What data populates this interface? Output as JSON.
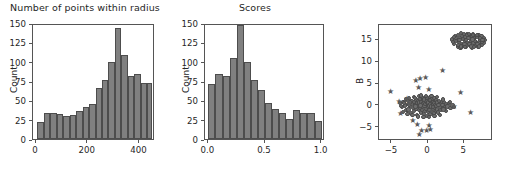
{
  "figure": {
    "width": 509,
    "height": 178,
    "background": "#ffffff",
    "bar_color": "#808080",
    "bar_edge_color": "#4d4d4d",
    "marker_color": "#6e6e6e",
    "axis_color": "#555555",
    "text_color": "#262626"
  },
  "chart_data": [
    {
      "type": "bar",
      "title": "Number of points within radius",
      "xlabel": "",
      "ylabel": "Count",
      "xlim": [
        -12,
        460
      ],
      "ylim": [
        0,
        150
      ],
      "xticks": [
        0,
        200,
        400
      ],
      "xticklabels": [
        "0",
        "200",
        "400"
      ],
      "yticks": [
        0,
        25,
        50,
        75,
        100,
        125,
        150
      ],
      "yticklabels": [
        "0",
        "25",
        "50",
        "75",
        "100",
        "125",
        "150"
      ],
      "grid": false,
      "legend": "none",
      "bin_edges": [
        5,
        30,
        55,
        80,
        105,
        130,
        155,
        180,
        205,
        230,
        255,
        280,
        305,
        330,
        355,
        380,
        405,
        430,
        450
      ],
      "categories": [
        "5-30",
        "30-55",
        "55-80",
        "80-105",
        "105-130",
        "130-155",
        "155-180",
        "180-205",
        "205-230",
        "230-255",
        "255-280",
        "280-305",
        "305-330",
        "330-355",
        "355-380",
        "380-405",
        "405-430",
        "430-450"
      ],
      "values": [
        22,
        33,
        33,
        32,
        30,
        31,
        36,
        42,
        45,
        66,
        76,
        100,
        143,
        109,
        82,
        84,
        72,
        72
      ]
    },
    {
      "type": "bar",
      "title": "Scores",
      "xlabel": "",
      "ylabel": "Count",
      "xlim": [
        -0.03,
        1.03
      ],
      "ylim": [
        0,
        150
      ],
      "xticks": [
        0.0,
        0.5,
        1.0
      ],
      "xticklabels": [
        "0.0",
        "0.5",
        "1.0"
      ],
      "yticks": [
        0,
        25,
        50,
        75,
        100,
        125,
        150
      ],
      "yticklabels": [
        "0",
        "25",
        "50",
        "75",
        "100",
        "125",
        "150"
      ],
      "grid": false,
      "legend": "none",
      "bin_edges": [
        0.0,
        0.0625,
        0.125,
        0.1875,
        0.25,
        0.3125,
        0.375,
        0.4375,
        0.5,
        0.5625,
        0.625,
        0.6875,
        0.75,
        0.8125,
        0.875,
        0.9375,
        1.0
      ],
      "categories": [
        "0.000-0.063",
        "0.063-0.125",
        "0.125-0.188",
        "0.188-0.250",
        "0.250-0.313",
        "0.313-0.375",
        "0.375-0.438",
        "0.438-0.500",
        "0.500-0.563",
        "0.563-0.625",
        "0.625-0.688",
        "0.688-0.750",
        "0.750-0.813",
        "0.813-0.875",
        "0.875-0.938",
        "0.938-1.000"
      ],
      "values": [
        71,
        84,
        82,
        105,
        148,
        100,
        76,
        63,
        47,
        39,
        34,
        26,
        37,
        33,
        33,
        23
      ]
    },
    {
      "type": "scatter",
      "title": "",
      "xlabel": "",
      "ylabel": "B",
      "xlim": [
        -6.8,
        9.0
      ],
      "ylim": [
        -8.0,
        18.5
      ],
      "xticks": [
        -5,
        0,
        5
      ],
      "xticklabels": [
        "−5",
        "0",
        "5"
      ],
      "yticks": [
        -5,
        0,
        5,
        10,
        15
      ],
      "yticklabels": [
        "−5",
        "0",
        "5",
        "10",
        "15"
      ],
      "grid": false,
      "legend": "none",
      "series": [
        {
          "name": "cluster-upper",
          "marker": "circle",
          "points": [
            [
              3.3,
              15.2
            ],
            [
              3.6,
              14.2
            ],
            [
              3.7,
              16.0
            ],
            [
              4.0,
              15.1
            ],
            [
              4.1,
              13.6
            ],
            [
              4.2,
              16.3
            ],
            [
              4.3,
              14.6
            ],
            [
              4.4,
              15.6
            ],
            [
              4.5,
              13.2
            ],
            [
              4.6,
              16.6
            ],
            [
              4.7,
              14.1
            ],
            [
              4.8,
              15.3
            ],
            [
              4.9,
              13.8
            ],
            [
              5.0,
              16.1
            ],
            [
              5.1,
              14.8
            ],
            [
              5.2,
              15.8
            ],
            [
              5.3,
              13.4
            ],
            [
              5.4,
              16.4
            ],
            [
              5.5,
              14.4
            ],
            [
              5.6,
              15.5
            ],
            [
              5.7,
              13.9
            ],
            [
              5.8,
              16.2
            ],
            [
              5.9,
              14.9
            ],
            [
              6.0,
              15.9
            ],
            [
              6.1,
              13.3
            ],
            [
              6.2,
              16.5
            ],
            [
              6.3,
              14.3
            ],
            [
              6.4,
              15.4
            ],
            [
              6.5,
              13.7
            ],
            [
              6.6,
              16.0
            ],
            [
              6.7,
              14.7
            ],
            [
              6.8,
              15.7
            ],
            [
              6.9,
              13.5
            ],
            [
              7.0,
              16.3
            ],
            [
              7.1,
              14.5
            ],
            [
              7.2,
              15.2
            ],
            [
              7.3,
              14.0
            ],
            [
              7.4,
              15.9
            ],
            [
              7.5,
              13.9
            ],
            [
              7.6,
              14.8
            ],
            [
              7.7,
              15.4
            ],
            [
              7.8,
              14.3
            ],
            [
              7.9,
              15.0
            ],
            [
              3.9,
              14.9
            ],
            [
              4.35,
              15.0
            ],
            [
              5.05,
              14.2
            ],
            [
              5.75,
              14.1
            ],
            [
              6.45,
              14.9
            ],
            [
              7.15,
              15.6
            ],
            [
              4.75,
              16.0
            ],
            [
              5.45,
              16.2
            ],
            [
              6.15,
              15.2
            ],
            [
              6.85,
              14.2
            ],
            [
              3.5,
              14.6
            ],
            [
              4.15,
              14.0
            ],
            [
              5.25,
              15.1
            ],
            [
              6.05,
              16.0
            ],
            [
              6.75,
              16.2
            ],
            [
              7.45,
              14.6
            ],
            [
              3.8,
              15.6
            ],
            [
              4.55,
              13.6
            ],
            [
              5.15,
              13.5
            ],
            [
              5.95,
              13.6
            ],
            [
              6.35,
              13.4
            ],
            [
              7.05,
              13.6
            ],
            [
              4.95,
              16.4
            ],
            [
              5.65,
              16.5
            ],
            [
              6.25,
              16.3
            ],
            [
              3.65,
              15.8
            ],
            [
              7.55,
              15.1
            ]
          ]
        },
        {
          "name": "cluster-lower",
          "marker": "circle",
          "points": [
            [
              -3.9,
              0.6
            ],
            [
              -3.6,
              -0.3
            ],
            [
              -3.4,
              1.0
            ],
            [
              -3.2,
              0.1
            ],
            [
              -3.0,
              -1.0
            ],
            [
              -2.9,
              1.4
            ],
            [
              -2.8,
              0.4
            ],
            [
              -2.7,
              -0.8
            ],
            [
              -2.6,
              1.8
            ],
            [
              -2.5,
              0.0
            ],
            [
              -2.4,
              -1.6
            ],
            [
              -2.3,
              1.1
            ],
            [
              -2.2,
              0.5
            ],
            [
              -2.1,
              -0.5
            ],
            [
              -2.0,
              2.0
            ],
            [
              -1.95,
              0.9
            ],
            [
              -1.9,
              -1.2
            ],
            [
              -1.8,
              0.2
            ],
            [
              -1.7,
              1.5
            ],
            [
              -1.6,
              -0.6
            ],
            [
              -1.55,
              0.7
            ],
            [
              -1.5,
              -2.0
            ],
            [
              -1.45,
              1.2
            ],
            [
              -1.4,
              0.0
            ],
            [
              -1.3,
              -1.0
            ],
            [
              -1.25,
              2.2
            ],
            [
              -1.2,
              0.8
            ],
            [
              -1.15,
              -0.4
            ],
            [
              -1.1,
              1.6
            ],
            [
              -1.0,
              -1.5
            ],
            [
              -0.95,
              0.3
            ],
            [
              -0.9,
              1.0
            ],
            [
              -0.85,
              -0.9
            ],
            [
              -0.8,
              2.1
            ],
            [
              -0.75,
              0.6
            ],
            [
              -0.7,
              -0.2
            ],
            [
              -0.65,
              1.3
            ],
            [
              -0.6,
              -1.8
            ],
            [
              -0.55,
              0.9
            ],
            [
              -0.5,
              0.0
            ],
            [
              -0.45,
              -1.1
            ],
            [
              -0.4,
              1.7
            ],
            [
              -0.35,
              0.4
            ],
            [
              -0.3,
              -0.7
            ],
            [
              -0.25,
              1.1
            ],
            [
              -0.2,
              -2.2
            ],
            [
              -0.15,
              0.7
            ],
            [
              -0.1,
              1.9
            ],
            [
              -0.05,
              -0.3
            ],
            [
              0.0,
              0.8
            ],
            [
              0.05,
              -1.4
            ],
            [
              0.1,
              1.4
            ],
            [
              0.15,
              0.1
            ],
            [
              0.2,
              -0.9
            ],
            [
              0.25,
              2.0
            ],
            [
              0.3,
              0.5
            ],
            [
              0.35,
              -1.9
            ],
            [
              0.4,
              1.2
            ],
            [
              0.45,
              -0.1
            ],
            [
              0.5,
              0.9
            ],
            [
              0.55,
              -1.3
            ],
            [
              0.6,
              1.6
            ],
            [
              0.65,
              0.2
            ],
            [
              0.7,
              -0.6
            ],
            [
              0.75,
              1.0
            ],
            [
              0.8,
              -1.7
            ],
            [
              0.85,
              0.6
            ],
            [
              0.9,
              1.8
            ],
            [
              0.95,
              -0.4
            ],
            [
              1.0,
              0.3
            ],
            [
              1.05,
              -1.1
            ],
            [
              1.1,
              1.3
            ],
            [
              1.15,
              0.0
            ],
            [
              1.2,
              -0.8
            ],
            [
              1.3,
              0.8
            ],
            [
              1.4,
              -1.5
            ],
            [
              1.5,
              1.1
            ],
            [
              1.6,
              -0.2
            ],
            [
              1.7,
              0.5
            ],
            [
              1.8,
              -1.0
            ],
            [
              1.9,
              0.9
            ],
            [
              2.0,
              0.2
            ],
            [
              2.1,
              -0.5
            ],
            [
              2.2,
              1.0
            ],
            [
              2.3,
              -0.3
            ],
            [
              2.5,
              0.4
            ],
            [
              2.7,
              -0.1
            ],
            [
              2.9,
              0.7
            ],
            [
              3.1,
              -0.4
            ],
            [
              3.4,
              0.1
            ],
            [
              3.6,
              -0.2
            ],
            [
              -3.7,
              0.0
            ],
            [
              -3.5,
              -1.3
            ],
            [
              -3.1,
              1.6
            ],
            [
              -2.85,
              -1.9
            ],
            [
              -2.45,
              0.8
            ],
            [
              -2.15,
              -2.1
            ],
            [
              -1.85,
              1.9
            ],
            [
              -1.35,
              -2.4
            ],
            [
              -0.98,
              2.4
            ],
            [
              -0.62,
              -2.6
            ],
            [
              -0.28,
              2.3
            ],
            [
              0.12,
              -2.5
            ],
            [
              0.48,
              2.2
            ],
            [
              0.88,
              -2.3
            ],
            [
              1.25,
              2.1
            ],
            [
              1.65,
              -2.0
            ],
            [
              2.05,
              1.5
            ],
            [
              2.45,
              -1.2
            ],
            [
              -3.3,
              0.7
            ],
            [
              -2.65,
              0.2
            ],
            [
              -1.75,
              -0.1
            ],
            [
              -1.05,
              0.1
            ],
            [
              -0.52,
              1.5
            ],
            [
              0.22,
              1.3
            ],
            [
              0.72,
              -0.3
            ],
            [
              1.45,
              0.3
            ],
            [
              2.15,
              -0.8
            ],
            [
              3.0,
              0.9
            ]
          ]
        },
        {
          "name": "outliers",
          "marker": "star",
          "points": [
            [
              -5.2,
              3.2
            ],
            [
              -4.0,
              0.9
            ],
            [
              -3.8,
              -1.9
            ],
            [
              -2.6,
              0.5
            ],
            [
              -2.1,
              -3.5
            ],
            [
              -1.7,
              5.6
            ],
            [
              -1.5,
              -4.3
            ],
            [
              -1.3,
              4.2
            ],
            [
              -1.2,
              -6.7
            ],
            [
              -1.1,
              6.1
            ],
            [
              -0.9,
              -5.7
            ],
            [
              -0.35,
              6.5
            ],
            [
              -0.2,
              -5.8
            ],
            [
              0.1,
              3.6
            ],
            [
              0.3,
              -5.6
            ],
            [
              0.5,
              -1.4
            ],
            [
              2.0,
              7.9
            ],
            [
              3.6,
              -0.3
            ],
            [
              4.5,
              3.0
            ],
            [
              5.9,
              -1.5
            ],
            [
              -2.9,
              1.6
            ],
            [
              0.15,
              -4.6
            ]
          ]
        }
      ]
    }
  ]
}
